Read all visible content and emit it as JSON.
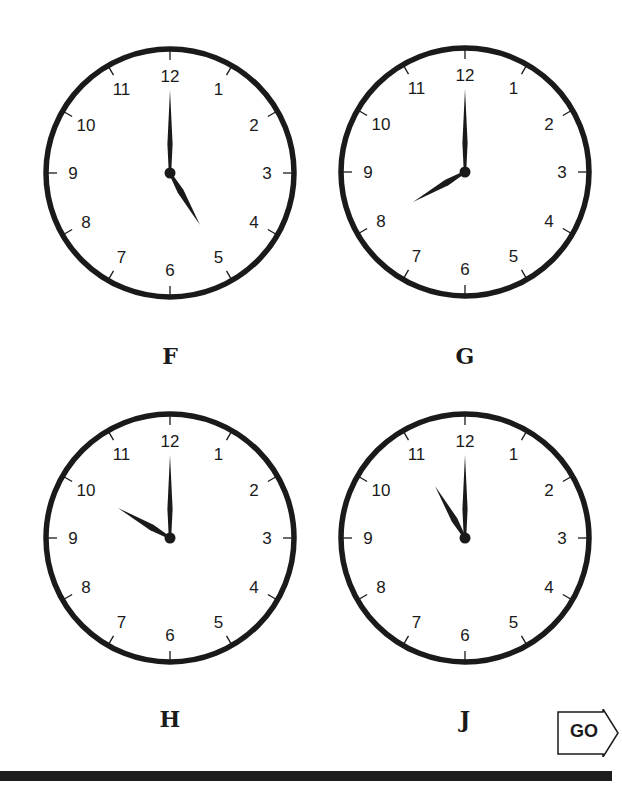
{
  "clocks": [
    {
      "label": "F",
      "time": "5:00",
      "hour": 5,
      "minute": 0,
      "cx": 170,
      "cy": 173
    },
    {
      "label": "G",
      "time": "8:00",
      "hour": 8,
      "minute": 0,
      "cx": 465,
      "cy": 172
    },
    {
      "label": "H",
      "time": "10:00",
      "hour": 10,
      "minute": 0,
      "cx": 170,
      "cy": 538
    },
    {
      "label": "J",
      "time": "11:00",
      "hour": 11,
      "minute": 0,
      "cx": 465,
      "cy": 538
    }
  ],
  "dial_numbers": [
    "12",
    "1",
    "2",
    "3",
    "4",
    "5",
    "6",
    "7",
    "8",
    "9",
    "10",
    "11"
  ],
  "go_button": {
    "label": "GO",
    "icon": "right-arrow-icon"
  },
  "colors": {
    "ink": "#1a1a1a",
    "background": "#ffffff"
  }
}
